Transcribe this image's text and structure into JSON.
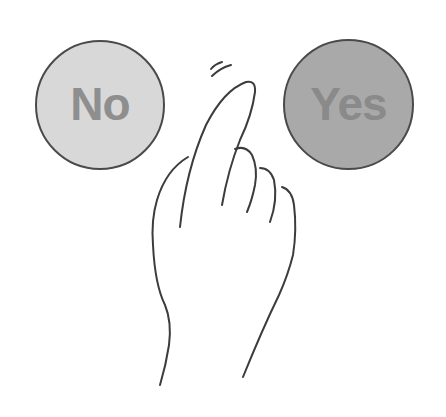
{
  "buttons": {
    "no": {
      "label": "No",
      "fill": "#d8d8d8",
      "text_color": "#8e8e8e"
    },
    "yes": {
      "label": "Yes",
      "fill": "#a9a9a9",
      "text_color": "#8a8a8a"
    }
  },
  "illustration": {
    "subject": "hand-pointing-icon",
    "stroke_color": "#3c3c3c"
  }
}
